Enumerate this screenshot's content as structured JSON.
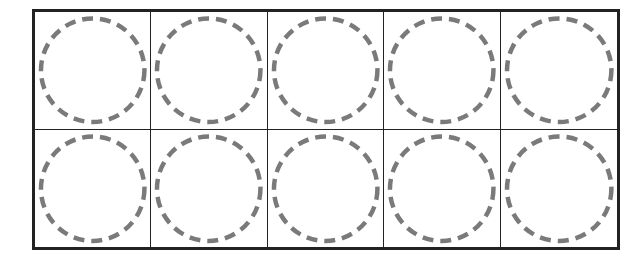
{
  "ten_frame": {
    "rows": 2,
    "columns": 5,
    "cells": [
      {
        "row": 1,
        "col": 1,
        "content": "empty-dashed-circle"
      },
      {
        "row": 1,
        "col": 2,
        "content": "empty-dashed-circle"
      },
      {
        "row": 1,
        "col": 3,
        "content": "empty-dashed-circle"
      },
      {
        "row": 1,
        "col": 4,
        "content": "empty-dashed-circle"
      },
      {
        "row": 1,
        "col": 5,
        "content": "empty-dashed-circle"
      },
      {
        "row": 2,
        "col": 1,
        "content": "empty-dashed-circle"
      },
      {
        "row": 2,
        "col": 2,
        "content": "empty-dashed-circle"
      },
      {
        "row": 2,
        "col": 3,
        "content": "empty-dashed-circle"
      },
      {
        "row": 2,
        "col": 4,
        "content": "empty-dashed-circle"
      },
      {
        "row": 2,
        "col": 5,
        "content": "empty-dashed-circle"
      }
    ],
    "colors": {
      "border": "#222222",
      "circle_stroke": "#7a7a7a",
      "background": "#ffffff"
    }
  }
}
